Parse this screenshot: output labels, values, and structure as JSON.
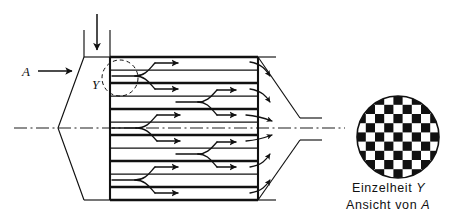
{
  "figure": {
    "kind": "engineering-section-drawing",
    "language": "de",
    "background_color": "#ffffff",
    "ink_color": "#111111"
  },
  "labels": {
    "view_direction": "A",
    "detail_marker": "Y"
  },
  "caption": {
    "line1_text": "Einzelheit ",
    "line1_italic": "Y",
    "line2_text": "Ansicht von ",
    "line2_italic": "A"
  },
  "detail_view": {
    "name": "checkerboard-matrix-circle",
    "pattern": "checkerboard",
    "cells_across": 9,
    "cells_down": 9,
    "cell_px": 9.2,
    "circle_center_x": 398,
    "circle_center_y": 137,
    "circle_radius": 41,
    "dark_color": "#111111",
    "light_color": "#ffffff"
  },
  "housing": {
    "name": "outer-housing-section",
    "left_apex_x": 58,
    "right_apex_x": 300,
    "top_y": 57,
    "bottom_y": 200,
    "centerline_y": 128
  },
  "core": {
    "name": "channel-core-block",
    "left_x": 110,
    "right_x": 258,
    "top_y": 57,
    "bottom_y": 200,
    "band_count": 11,
    "band_divider_ys": [
      57,
      70,
      83,
      96,
      109,
      122,
      135,
      148,
      161,
      174,
      187,
      200
    ]
  },
  "inlet": {
    "name": "top-inlet-duct",
    "left_wall_x": 84,
    "right_wall_x": 110,
    "top_y": 28,
    "arrow_x": 97,
    "arrow_top_y": 14,
    "arrow_tip_y": 52
  },
  "outlet": {
    "name": "outlet-nozzle",
    "upper_y": 118,
    "lower_y": 140,
    "tip_x": 322
  },
  "detail_circle": {
    "name": "detail-region-circle",
    "center_x": 118,
    "center_y": 78,
    "radius": 17,
    "style": "dashed"
  },
  "view_arrow": {
    "name": "view-direction-arrow-a",
    "label_x": 26,
    "label_y": 76,
    "line_start_x": 38,
    "line_end_x": 72,
    "y": 71
  },
  "flow_arrows": {
    "name": "flow-branching-arrows",
    "description": "Branch arrows splitting into upper and lower channels along the core",
    "count": 10
  },
  "centerline": {
    "name": "axis-centerline",
    "style": "dash-dot",
    "y": 128,
    "x_start": 14,
    "x_end": 345
  }
}
